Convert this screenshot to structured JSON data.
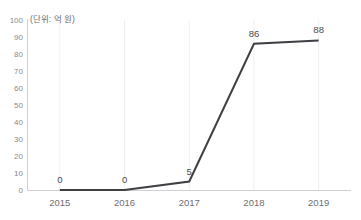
{
  "top_strip": {
    "segment_a": "",
    "segment_b": "",
    "segment_c": ""
  },
  "unit_label": "(단위: 억 원)",
  "colors": {
    "line": "#3f3f44",
    "axis": "#d0d0d4",
    "grid": "#efeff2",
    "tick_text": "#8a8a8f",
    "label_text": "#4a4a4f",
    "background": "#ffffff"
  },
  "chart_data": {
    "type": "line",
    "title": "",
    "subtitle": "",
    "xlabel": "",
    "ylabel": "(단위: 억 원)",
    "categories": [
      "2015",
      "2016",
      "2017",
      "2018",
      "2019"
    ],
    "values": [
      0,
      0,
      5,
      86,
      88
    ],
    "data_labels": [
      "0",
      "0",
      "5",
      "86",
      "88"
    ],
    "ylim": [
      0,
      100
    ],
    "ytick_labels": [
      "100",
      "90",
      "80",
      "70",
      "60",
      "50",
      "40",
      "30",
      "20",
      "10",
      "0"
    ],
    "ytick_values": [
      100,
      90,
      80,
      70,
      60,
      50,
      40,
      30,
      20,
      10,
      0
    ],
    "ytick_step": 10,
    "grid": "vertical-faint",
    "legend": "none",
    "markers": false,
    "series": [
      {
        "name": "",
        "values": [
          0,
          0,
          5,
          86,
          88
        ]
      }
    ]
  }
}
